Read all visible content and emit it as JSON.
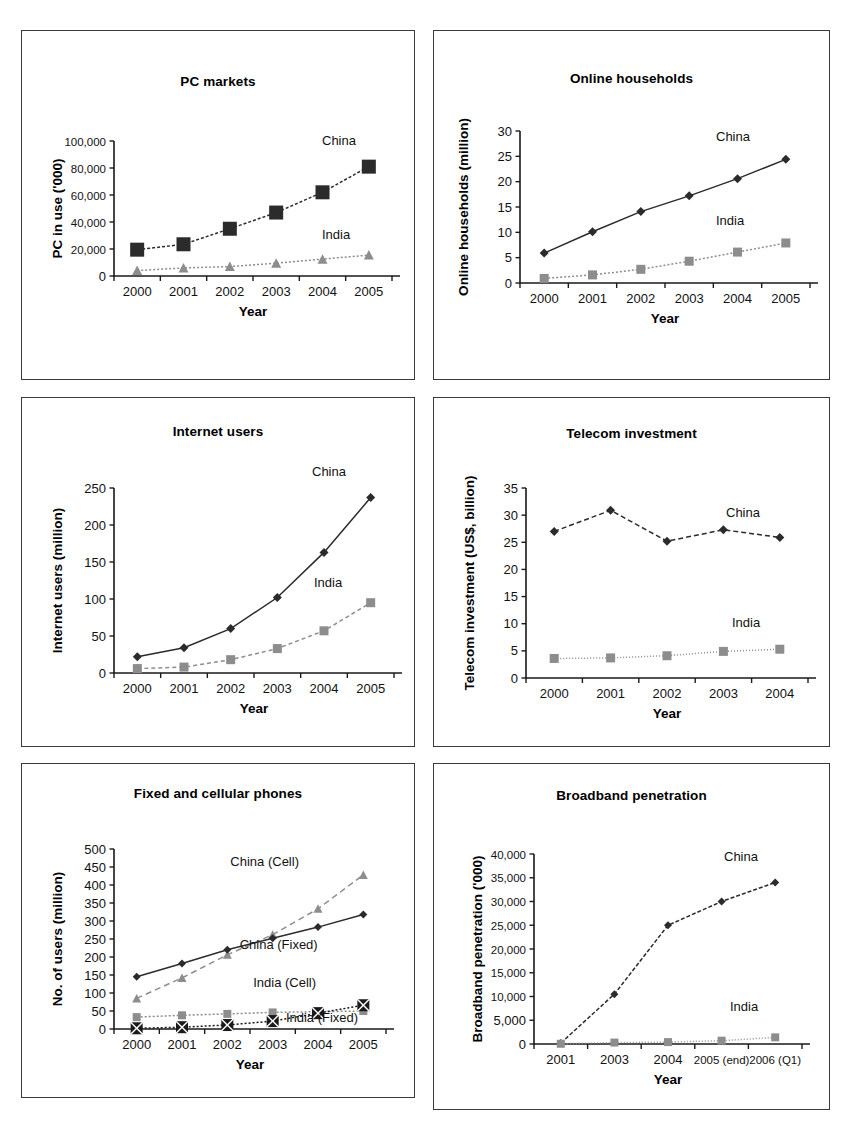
{
  "page": {
    "background": "#ffffff",
    "panel_border_color": "#3a3a3a",
    "series_colors": {
      "china": "#2b2b2b",
      "india": "#8d8d8d",
      "china_cell": "#8d8d8d",
      "india_cell": "#1a1a1a"
    }
  },
  "panels": [
    {
      "id": "pc-markets",
      "title": "PC markets"
    },
    {
      "id": "online-households",
      "title": "Online households"
    },
    {
      "id": "internet-users",
      "title": "Internet users"
    },
    {
      "id": "telecom-investment",
      "title": "Telecom investment"
    },
    {
      "id": "fixed-cellular-phones",
      "title": "Fixed and cellular phones"
    },
    {
      "id": "broadband-penetration",
      "title": "Broadband penetration"
    }
  ],
  "chart_data": [
    {
      "id": "pc-markets",
      "type": "line",
      "title": "PC markets",
      "xlabel": "Year",
      "ylabel": "PC in use ('000)",
      "categories": [
        "2000",
        "2001",
        "2002",
        "2003",
        "2004",
        "2005"
      ],
      "ylim": [
        0,
        100000
      ],
      "yticks": [
        0,
        20000,
        40000,
        60000,
        80000,
        100000
      ],
      "ytick_labels": [
        "0",
        "20,000",
        "40,000",
        "60,000",
        "80,000",
        "100,000"
      ],
      "grid": false,
      "legend_position": "inline-right",
      "series": [
        {
          "name": "China",
          "marker": "square",
          "color": "#2b2b2b",
          "dash": "3 2",
          "values": [
            19500,
            23500,
            35000,
            47000,
            62000,
            81000
          ]
        },
        {
          "name": "India",
          "marker": "triangle",
          "color": "#8d8d8d",
          "dash": "2 2",
          "values": [
            4000,
            6000,
            7000,
            9500,
            12500,
            15500
          ]
        }
      ]
    },
    {
      "id": "online-households",
      "type": "line",
      "title": "Online households",
      "xlabel": "Year",
      "ylabel": "Online households (million)",
      "categories": [
        "2000",
        "2001",
        "2002",
        "2003",
        "2004",
        "2005"
      ],
      "ylim": [
        0,
        30
      ],
      "yticks": [
        0,
        5,
        10,
        15,
        20,
        25,
        30
      ],
      "ytick_labels": [
        "0",
        "5",
        "10",
        "15",
        "20",
        "25",
        "30"
      ],
      "grid": false,
      "legend_position": "inline-right",
      "series": [
        {
          "name": "China",
          "marker": "diamond",
          "color": "#2b2b2b",
          "dash": "0",
          "values": [
            5.9,
            10.1,
            14.1,
            17.2,
            20.6,
            24.4
          ]
        },
        {
          "name": "India",
          "marker": "square",
          "color": "#8d8d8d",
          "dash": "2 2",
          "values": [
            0.9,
            1.6,
            2.7,
            4.3,
            6.1,
            7.9
          ]
        }
      ]
    },
    {
      "id": "internet-users",
      "type": "line",
      "title": "Internet users",
      "xlabel": "Year",
      "ylabel": "Internet users (million)",
      "categories": [
        "2000",
        "2001",
        "2002",
        "2003",
        "2004",
        "2005"
      ],
      "ylim": [
        0,
        250
      ],
      "yticks": [
        0,
        50,
        100,
        150,
        200,
        250
      ],
      "ytick_labels": [
        "0",
        "50",
        "100",
        "150",
        "200",
        "250"
      ],
      "grid": false,
      "legend_position": "inline-right",
      "series": [
        {
          "name": "China",
          "marker": "diamond",
          "color": "#2b2b2b",
          "dash": "0",
          "values": [
            22,
            34,
            60,
            102,
            163,
            237
          ]
        },
        {
          "name": "India",
          "marker": "square",
          "color": "#8d8d8d",
          "dash": "4 3",
          "values": [
            6,
            8,
            18,
            33,
            57,
            95
          ]
        }
      ]
    },
    {
      "id": "telecom-investment",
      "type": "line",
      "title": "Telecom investment",
      "xlabel": "Year",
      "ylabel": "Telecom investment (US$, billion)",
      "categories": [
        "2000",
        "2001",
        "2002",
        "2003",
        "2004"
      ],
      "ylim": [
        0,
        35
      ],
      "yticks": [
        0,
        5,
        10,
        15,
        20,
        25,
        30,
        35
      ],
      "ytick_labels": [
        "0",
        "5",
        "10",
        "15",
        "20",
        "25",
        "30",
        "35"
      ],
      "grid": false,
      "legend_position": "inline-right",
      "series": [
        {
          "name": "China",
          "marker": "diamond",
          "color": "#2b2b2b",
          "dash": "5 3",
          "values": [
            27.0,
            30.9,
            25.2,
            27.3,
            25.9
          ]
        },
        {
          "name": "India",
          "marker": "square",
          "color": "#8d8d8d",
          "dash": "1 2",
          "values": [
            3.6,
            3.7,
            4.1,
            4.9,
            5.3
          ]
        }
      ]
    },
    {
      "id": "fixed-cellular-phones",
      "type": "line",
      "title": "Fixed and cellular phones",
      "xlabel": "Year",
      "ylabel": "No. of users (million)",
      "categories": [
        "2000",
        "2001",
        "2002",
        "2003",
        "2004",
        "2005"
      ],
      "ylim": [
        0,
        500
      ],
      "yticks": [
        0,
        50,
        100,
        150,
        200,
        250,
        300,
        350,
        400,
        450,
        500
      ],
      "ytick_labels": [
        "0",
        "50",
        "100",
        "150",
        "200",
        "250",
        "300",
        "350",
        "400",
        "450",
        "500"
      ],
      "grid": false,
      "legend_position": "inline",
      "series": [
        {
          "name": "China (Cell)",
          "marker": "triangle",
          "color": "#8d8d8d",
          "dash": "6 4",
          "values": [
            85,
            142,
            206,
            262,
            334,
            428
          ]
        },
        {
          "name": "China (Fixed)",
          "marker": "diamond",
          "color": "#2b2b2b",
          "dash": "0",
          "values": [
            145,
            182,
            220,
            252,
            283,
            318
          ]
        },
        {
          "name": "India (Cell)",
          "marker": "square",
          "color": "#8d8d8d",
          "dash": "2 2",
          "values": [
            33,
            38,
            42,
            46,
            48,
            50
          ]
        },
        {
          "name": "India (Fixed)",
          "marker": "xsquare",
          "color": "#1a1a1a",
          "dash": "2 2",
          "values": [
            2,
            5,
            11,
            22,
            44,
            66
          ]
        }
      ]
    },
    {
      "id": "broadband-penetration",
      "type": "line",
      "title": "Broadband penetration",
      "xlabel": "Year",
      "ylabel": "Broadband penetration ('000)",
      "categories": [
        "2001",
        "2003",
        "2004",
        "2005 (end)",
        "2006 (Q1)"
      ],
      "ylim": [
        0,
        40000
      ],
      "yticks": [
        0,
        5000,
        10000,
        15000,
        20000,
        25000,
        30000,
        35000,
        40000
      ],
      "ytick_labels": [
        "0",
        "5,000",
        "10,000",
        "15,000",
        "20,000",
        "25,000",
        "30,000",
        "35,000",
        "40,000"
      ],
      "grid": false,
      "legend_position": "inline-right",
      "series": [
        {
          "name": "China",
          "marker": "diamond",
          "color": "#2b2b2b",
          "dash": "4 2",
          "values": [
            200,
            10500,
            25000,
            30000,
            34000
          ]
        },
        {
          "name": "India",
          "marker": "square",
          "color": "#8d8d8d",
          "dash": "1 2",
          "values": [
            50,
            300,
            400,
            700,
            1400
          ]
        }
      ]
    }
  ],
  "layout": {
    "pc-markets": {
      "plot": [
        92,
        110,
        278,
        135
      ],
      "title_top": 43,
      "label_offsets": {
        "China": [
          208,
          -22
        ],
        "India": [
          208,
          -16
        ]
      }
    },
    "online-households": {
      "plot": [
        86,
        100,
        290,
        152
      ],
      "title_top": 40,
      "label_offsets": {
        "China": [
          196,
          -18
        ],
        "India": [
          196,
          -18
        ]
      }
    },
    "internet-users": {
      "plot": [
        92,
        90,
        280,
        185
      ],
      "title_top": 26,
      "label_offsets": {
        "China": [
          198,
          -22
        ],
        "India": [
          200,
          -16
        ]
      }
    },
    "telecom-investment": {
      "plot": [
        92,
        90,
        282,
        190
      ],
      "title_top": 28,
      "label_offsets": {
        "China": [
          200,
          -20
        ],
        "India": [
          206,
          -22
        ]
      }
    },
    "fixed-cellular-phones": {
      "plot": [
        92,
        85,
        272,
        180
      ],
      "title_top": 22,
      "label_offsets": {}
    },
    "broadband-penetration": {
      "plot": [
        100,
        90,
        268,
        190
      ],
      "title_top": 24,
      "label_offsets": {
        "China": [
          190,
          -22
        ],
        "India": [
          196,
          -26
        ]
      }
    }
  }
}
